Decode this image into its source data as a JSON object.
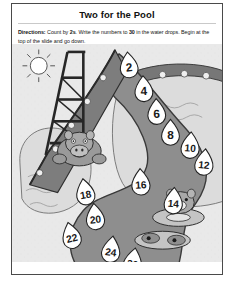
{
  "worksheet": {
    "title": "Two for the Pool",
    "directions_prefix": "Directions:",
    "directions_part1": " Count by ",
    "directions_bold1": "2s",
    "directions_part2": ". Write the numbers to ",
    "directions_bold2": "30",
    "directions_part3": " in the water drops. Begin at the top of the slide and go down."
  },
  "illustration": {
    "scene_name": "swimming-pool-with-water-slide",
    "sun_label": "sun",
    "slide_label": "water-slide",
    "ladder_label": "slide-ladder",
    "pool_label": "swimming-pool",
    "path_label": "numbered-water-path",
    "characters": [
      {
        "name": "hippo-on-slide"
      },
      {
        "name": "hippo-on-float-upper"
      },
      {
        "name": "hippo-on-float-lower"
      }
    ]
  },
  "colors": {
    "page_border": "#4a4a4a",
    "art_background": "#e9e9e9",
    "path_fill": "#8e8e8e",
    "pool_fill": "#d8d8d8",
    "drop_fill": "#ffffff",
    "drop_stroke": "#222222",
    "slide_fill": "#6f6f6f",
    "ink": "#1a1a1a"
  },
  "number_drops": [
    {
      "value": "2",
      "x": 118,
      "y": 22,
      "r": 9.0,
      "rot": -6
    },
    {
      "value": "4",
      "x": 133,
      "y": 46,
      "r": 9.0,
      "rot": -3
    },
    {
      "value": "6",
      "x": 146,
      "y": 69,
      "r": 9.0,
      "rot": -2
    },
    {
      "value": "8",
      "x": 160,
      "y": 90,
      "r": 9.0,
      "rot": 0
    },
    {
      "value": "10",
      "x": 180,
      "y": 103,
      "r": 9.2,
      "rot": 4
    },
    {
      "value": "12",
      "x": 194,
      "y": 120,
      "r": 9.2,
      "rot": 6
    },
    {
      "value": "14",
      "x": 163,
      "y": 159,
      "r": 9.2,
      "rot": 4
    },
    {
      "value": "16",
      "x": 130,
      "y": 140,
      "r": 9.2,
      "rot": -3
    },
    {
      "value": "18",
      "x": 74,
      "y": 150,
      "r": 9.2,
      "rot": -10
    },
    {
      "value": "20",
      "x": 84,
      "y": 175,
      "r": 9.2,
      "rot": -6
    },
    {
      "value": "22",
      "x": 60,
      "y": 194,
      "r": 9.2,
      "rot": -14
    },
    {
      "value": "24",
      "x": 100,
      "y": 208,
      "r": 9.2,
      "rot": 8
    },
    {
      "value": "26",
      "x": 122,
      "y": 220,
      "r": 9.2,
      "rot": 10
    },
    {
      "value": "28",
      "x": 157,
      "y": 249,
      "r": 9.2,
      "rot": 12
    },
    {
      "value": "30",
      "x": 176,
      "y": 252,
      "r": 9.2,
      "rot": 6
    }
  ]
}
